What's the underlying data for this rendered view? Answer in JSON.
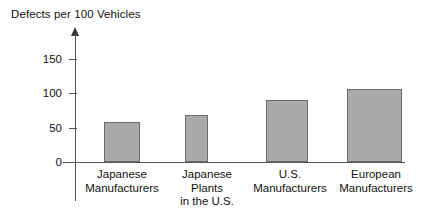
{
  "chart_data": {
    "type": "bar",
    "title": "Defects per 100 Vehicles",
    "xlabel": "",
    "ylabel": "",
    "categories": [
      "Japanese\nManufacturers",
      "Japanese\nPlants\nin the U.S.",
      "U.S.\nManufacturers",
      "European\nManufacturers"
    ],
    "values": [
      58,
      68,
      90,
      107
    ],
    "ylim": [
      0,
      175
    ],
    "yticks": [
      0,
      50,
      100,
      150
    ],
    "ytick_labels": [
      "0",
      "50",
      "100",
      "150"
    ],
    "grid": false,
    "legend": "none",
    "bar_fill_color": "#a9a9a9",
    "bar_border_color": "#6b6b6b",
    "axis_color": "#555555",
    "text_color": "#111111",
    "background_color": "#ffffff"
  }
}
